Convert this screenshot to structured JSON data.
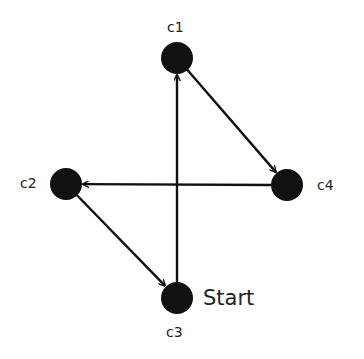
{
  "diagram": {
    "type": "directed-graph",
    "colors": {
      "node": "#111111",
      "edge": "#111111",
      "text": "#222222",
      "background": "#ffffff"
    },
    "nodes": [
      {
        "id": "c1",
        "label": "c1",
        "x": 177,
        "y": 58
      },
      {
        "id": "c2",
        "label": "c2",
        "x": 66,
        "y": 184
      },
      {
        "id": "c3",
        "label": "c3",
        "x": 177,
        "y": 298
      },
      {
        "id": "c4",
        "label": "c4",
        "x": 287,
        "y": 185
      }
    ],
    "edges": [
      {
        "from": "c3",
        "to": "c1"
      },
      {
        "from": "c1",
        "to": "c4"
      },
      {
        "from": "c4",
        "to": "c2"
      },
      {
        "from": "c2",
        "to": "c3"
      }
    ],
    "start_node": "c3",
    "start_label": "Start"
  }
}
